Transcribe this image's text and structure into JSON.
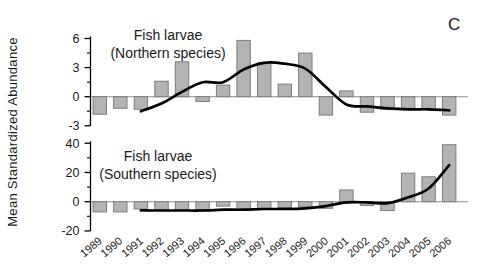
{
  "figure": {
    "panel_label": "C",
    "y_axis_label": "Mean Standardized Abundance",
    "colors": {
      "bar_fill": "#b3b3b3",
      "bar_stroke": "#7d7d7d",
      "trend": "#000000",
      "axis": "#000000",
      "zero_line": "#8c8c8c",
      "text": "#1a1a1a"
    }
  },
  "chart_data": [
    {
      "type": "bar",
      "panel": "northern",
      "title": "Fish larvae",
      "subtitle": "(Northern species)",
      "categories": [
        "1989",
        "1990",
        "1991",
        "1992",
        "1993",
        "1994",
        "1995",
        "1996",
        "1997",
        "1998",
        "1999",
        "2000",
        "2001",
        "2002",
        "2003",
        "2004",
        "2005",
        "2006"
      ],
      "values": [
        -1.8,
        -1.2,
        -1.3,
        1.6,
        3.6,
        -0.5,
        1.2,
        5.8,
        3.5,
        1.3,
        4.5,
        -1.9,
        0.6,
        -1.6,
        -1.3,
        -1.2,
        -1.3,
        -1.9
      ],
      "trend_line": {
        "x": [
          "1991",
          "1992",
          "1993",
          "1994",
          "1995",
          "1996",
          "1997",
          "1998",
          "1999",
          "2000",
          "2001",
          "2002",
          "2003",
          "2004",
          "2005",
          "2006"
        ],
        "values": [
          -1.5,
          -0.7,
          0.5,
          1.5,
          1.5,
          2.8,
          3.5,
          3.4,
          2.9,
          1.0,
          -0.8,
          -1.0,
          -1.2,
          -1.3,
          -1.3,
          -1.4
        ]
      },
      "yticks": [
        -3,
        0,
        3,
        6
      ],
      "ylim": [
        -3.3,
        7.2
      ],
      "grid": false,
      "legend": "none"
    },
    {
      "type": "bar",
      "panel": "southern",
      "title": "Fish larvae",
      "subtitle": "(Southern species)",
      "categories": [
        "1989",
        "1990",
        "1991",
        "1992",
        "1993",
        "1994",
        "1995",
        "1996",
        "1997",
        "1998",
        "1999",
        "2000",
        "2001",
        "2002",
        "2003",
        "2004",
        "2005",
        "2006"
      ],
      "values": [
        -7,
        -7,
        -5,
        -5.5,
        -5.5,
        -5.5,
        -3,
        -5.5,
        -5,
        -4,
        -3.5,
        -4.5,
        8,
        -2.5,
        -6,
        19.5,
        17,
        39
      ],
      "trend_line": {
        "x": [
          "1991",
          "1992",
          "1993",
          "1994",
          "1995",
          "1996",
          "1997",
          "1998",
          "1999",
          "2000",
          "2001",
          "2002",
          "2003",
          "2004",
          "2005",
          "2006"
        ],
        "values": [
          -6,
          -6,
          -6,
          -6,
          -5.5,
          -5.5,
          -5,
          -5,
          -4.5,
          -3,
          -0.5,
          -0.5,
          -1,
          3,
          9,
          25
        ]
      },
      "yticks": [
        -20,
        0,
        20,
        40
      ],
      "ylim": [
        -22,
        44
      ],
      "grid": false,
      "legend": "none"
    }
  ]
}
